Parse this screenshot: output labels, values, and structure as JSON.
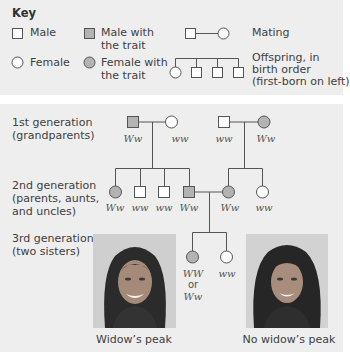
{
  "key": {
    "title": "Key",
    "male": "Male",
    "female": "Female",
    "male_trait": [
      "Male with",
      "the trait"
    ],
    "female_trait": [
      "Female with",
      "the trait"
    ],
    "mating": "Mating",
    "offspring": [
      "Offspring, in",
      "birth order",
      "(first-born on left)"
    ]
  },
  "generations": [
    {
      "label": [
        "1st generation",
        "(grandparents)"
      ]
    },
    {
      "label": [
        "2nd generation",
        "(parents, aunts,",
        "and uncles)"
      ]
    },
    {
      "label": [
        "3rd generation",
        "(two sisters)"
      ]
    }
  ],
  "genotypes": {
    "gen1": [
      "Ww",
      "ww",
      "ww",
      "Ww"
    ],
    "gen2": [
      "Ww",
      "ww",
      "ww",
      "Ww",
      "Ww",
      "ww"
    ],
    "gen3": {
      "left": [
        "WW",
        "or",
        "Ww"
      ],
      "right": "ww"
    }
  },
  "photos": [
    {
      "caption": "Widow’s peak"
    },
    {
      "caption": "No widow’s peak"
    }
  ],
  "colors": {
    "panel_bg": "#eeeeee",
    "trait_fill": "#b3b3b3",
    "line": "#555555"
  }
}
